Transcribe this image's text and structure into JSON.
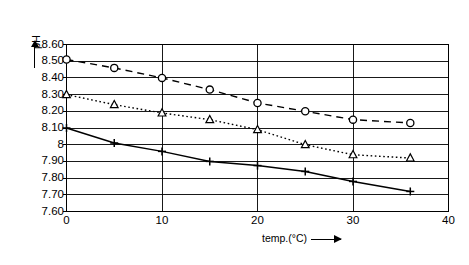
{
  "chart_data": {
    "type": "line",
    "title": "",
    "xlabel": "temp.(°C)",
    "ylabel": "pH",
    "xlim": [
      0,
      40
    ],
    "ylim": [
      7.6,
      8.6
    ],
    "grid": true,
    "legend": "none",
    "xticks": [
      "0",
      "10",
      "20",
      "30",
      "40"
    ],
    "xtick_values": [
      0,
      10,
      20,
      30,
      40
    ],
    "yticks": [
      "8.60",
      "8.50",
      "8.40",
      "8.30",
      "8.20",
      "8.10",
      "8",
      "7.90",
      "7.80",
      "7.70",
      "7.60"
    ],
    "ytick_values": [
      8.6,
      8.5,
      8.4,
      8.3,
      8.2,
      8.1,
      8.0,
      7.9,
      7.8,
      7.7,
      7.6
    ],
    "series": [
      {
        "name": "circle-dashed-series",
        "marker": "circle",
        "linestyle": "dashed",
        "color": "#000000",
        "x": [
          0,
          5,
          10,
          15,
          20,
          25,
          30,
          36
        ],
        "values": [
          8.51,
          8.46,
          8.4,
          8.33,
          8.25,
          8.2,
          8.15,
          8.13
        ]
      },
      {
        "name": "triangle-dotted-series",
        "marker": "triangle",
        "linestyle": "dotted",
        "color": "#000000",
        "x": [
          0,
          5,
          10,
          15,
          20,
          25,
          30,
          36
        ],
        "values": [
          8.3,
          8.24,
          8.19,
          8.15,
          8.09,
          8.0,
          7.94,
          7.92
        ]
      },
      {
        "name": "plus-solid-series",
        "marker": "plus",
        "linestyle": "solid",
        "color": "#000000",
        "x": [
          0,
          5,
          10,
          15,
          20,
          25,
          30,
          36
        ],
        "values": [
          8.1,
          8.01,
          7.96,
          7.9,
          7.875,
          7.84,
          7.78,
          7.72
        ]
      }
    ]
  },
  "axes": {
    "y_axis_label": "pH",
    "x_axis_label": "temp.(°C)",
    "arrow_glyph": "arrow-right"
  }
}
